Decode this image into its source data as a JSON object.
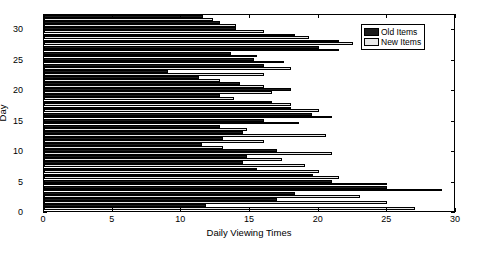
{
  "chart_data": {
    "type": "bar",
    "orientation": "horizontal",
    "title": "",
    "xlabel": "Daily Viewing Times",
    "ylabel": "Day",
    "xlim": [
      0,
      30
    ],
    "ylim": [
      0,
      32.5
    ],
    "xticks": [
      0,
      5,
      10,
      15,
      20,
      25,
      30
    ],
    "yticks": [
      0,
      5,
      10,
      15,
      20,
      25,
      30
    ],
    "grid": false,
    "legend_position": "top-right",
    "categories": [
      1,
      2,
      3,
      4,
      5,
      6,
      7,
      8,
      9,
      10,
      11,
      12,
      13,
      14,
      15,
      16,
      17,
      18,
      19,
      20,
      21,
      22,
      23,
      24,
      25,
      26,
      27,
      28,
      29,
      30,
      31,
      32
    ],
    "series": [
      {
        "name": "Old Items",
        "color": "#1c1c1c",
        "values": [
          11.8,
          17.0,
          18.3,
          25.0,
          21.0,
          19.6,
          15.5,
          14.5,
          14.8,
          17.0,
          11.5,
          13.0,
          14.5,
          12.8,
          16.0,
          19.5,
          18.0,
          16.6,
          12.8,
          18.0,
          14.3,
          11.3,
          9.0,
          16.0,
          15.3,
          13.6,
          20.0,
          21.5,
          18.3,
          14.0,
          12.8,
          11.6
        ]
      },
      {
        "name": "New Items",
        "color": "#e8e8e8",
        "values": [
          27.0,
          25.0,
          23.0,
          29.0,
          25.0,
          21.5,
          20.0,
          19.0,
          17.3,
          21.0,
          13.0,
          16.0,
          20.5,
          14.8,
          18.6,
          21.0,
          20.0,
          18.0,
          13.8,
          16.6,
          16.0,
          12.8,
          16.0,
          18.0,
          17.5,
          15.5,
          21.5,
          22.5,
          19.3,
          16.0,
          14.0,
          12.3
        ]
      }
    ]
  },
  "legend": {
    "items": [
      {
        "label": "Old Items"
      },
      {
        "label": "New Items"
      }
    ]
  },
  "axes": {
    "x_tick_labels": [
      "0",
      "5",
      "10",
      "15",
      "20",
      "25",
      "30"
    ],
    "y_tick_labels": [
      "0",
      "5",
      "10",
      "15",
      "20",
      "25",
      "30"
    ],
    "x_title": "Daily Viewing Times",
    "y_title": "Day"
  }
}
